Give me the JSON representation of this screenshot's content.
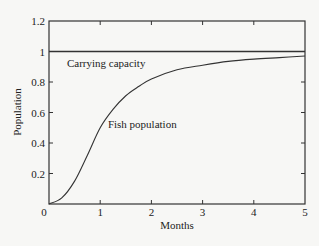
{
  "chart_data": {
    "type": "line",
    "title": "",
    "xlabel": "Months",
    "ylabel": "Population",
    "xlim": [
      0,
      5
    ],
    "ylim": [
      0,
      1.2
    ],
    "x_ticks": [
      0,
      1,
      2,
      3,
      4,
      5
    ],
    "x_tick_labels": [
      "0",
      "1",
      "2",
      "3",
      "4",
      "5"
    ],
    "y_ticks": [
      0.2,
      0.4,
      0.6,
      0.8,
      1,
      1.2
    ],
    "y_tick_labels": [
      "0.2",
      "0.4",
      "0.6",
      "0.8",
      "1",
      "1.2"
    ],
    "grid": false,
    "legend": null,
    "series": [
      {
        "name": "Carrying capacity",
        "x": [
          0,
          5
        ],
        "y": [
          1,
          1
        ]
      },
      {
        "name": "Fish population",
        "x": [
          0,
          0.25,
          0.5,
          0.75,
          1,
          1.25,
          1.5,
          1.75,
          2,
          2.5,
          3,
          3.5,
          4,
          4.5,
          5
        ],
        "y": [
          0,
          0.04,
          0.15,
          0.32,
          0.5,
          0.62,
          0.71,
          0.77,
          0.82,
          0.88,
          0.91,
          0.935,
          0.95,
          0.96,
          0.97
        ]
      }
    ],
    "annotations": [
      {
        "text": "Carrying capacity",
        "x": 0.35,
        "y": 0.9
      },
      {
        "text": "Fish population",
        "x": 1.15,
        "y": 0.5
      }
    ]
  },
  "colors": {
    "background": "#f7f7f5",
    "line": "#333333",
    "text": "#222222"
  }
}
